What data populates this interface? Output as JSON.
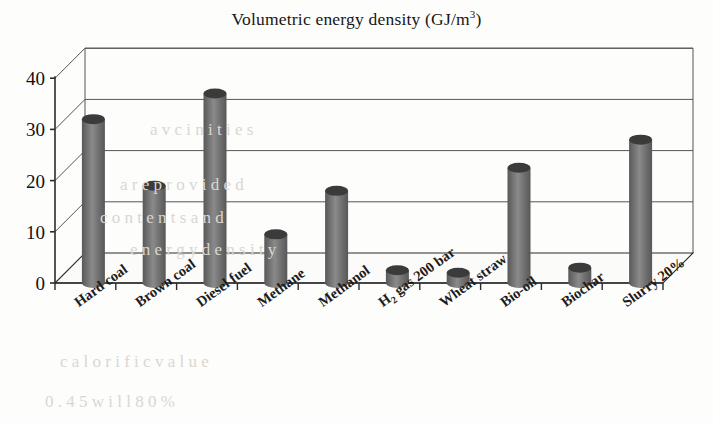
{
  "chart_data": {
    "type": "bar",
    "title": "Volumetric energy density (GJ/m3)",
    "title_main": "Volumetric energy density (GJ/m",
    "title_sup": "3",
    "title_tail": ")",
    "xlabel": "",
    "ylabel": "",
    "ylim": [
      0,
      40
    ],
    "yticks": [
      0,
      10,
      20,
      30,
      40
    ],
    "grid": true,
    "legend": "none",
    "style": "3d-cylinder",
    "categories": [
      "Hard coal",
      "Brown coal",
      "Diesel fuel",
      "Methane",
      "Methanol",
      "H2 gas 200 bar",
      "Wheat straw",
      "Bio-oil",
      "Biochar",
      "Slurry 20%"
    ],
    "category_labels": [
      {
        "pre": "Hard coal",
        "sub": "",
        "post": ""
      },
      {
        "pre": "Brown coal",
        "sub": "",
        "post": ""
      },
      {
        "pre": "Diesel fuel",
        "sub": "",
        "post": ""
      },
      {
        "pre": "Methane",
        "sub": "",
        "post": ""
      },
      {
        "pre": "Methanol",
        "sub": "",
        "post": ""
      },
      {
        "pre": "H",
        "sub": "2",
        "post": " gas 200 bar"
      },
      {
        "pre": "Wheat straw",
        "sub": "",
        "post": ""
      },
      {
        "pre": "Bio-oil",
        "sub": "",
        "post": ""
      },
      {
        "pre": "Biochar",
        "sub": "",
        "post": ""
      },
      {
        "pre": "Slurry 20%",
        "sub": "",
        "post": ""
      }
    ],
    "values": [
      32,
      19,
      37,
      9.5,
      18,
      2.5,
      2,
      22.5,
      3,
      28
    ],
    "colors": {
      "bar_body": "#6d6d6d",
      "bar_body_light": "#8a8a8a",
      "bar_body_dark": "#585858",
      "bar_cap": "#3b3b3b",
      "axis": "#2b2b2b",
      "grid": "#555555",
      "background": "#fdfdfc",
      "text": "#161616"
    }
  },
  "ghost_text": [
    {
      "t": "a  v  c  i  n  i  t  i  e  s",
      "x": 150,
      "y": 120
    },
    {
      "t": "a  r  e     p  r  o  v  i  d  e  d",
      "x": 120,
      "y": 175
    },
    {
      "t": "c  o  n  t  e  n  t  s     a  n  d",
      "x": 100,
      "y": 208
    },
    {
      "t": "e  n  e  r  g  y     d  e  n  s  i  t  y",
      "x": 130,
      "y": 240
    },
    {
      "t": "c  a  l  o  r  i  f  i  c     v  a  l  u  e",
      "x": 60,
      "y": 352
    },
    {
      "t": "0 .  4 5   w  i  l  l    8 0 %",
      "x": 45,
      "y": 392
    }
  ]
}
